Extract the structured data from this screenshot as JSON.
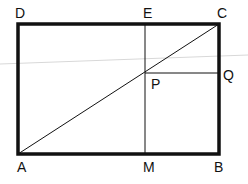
{
  "diagram": {
    "type": "geometry",
    "points": {
      "A": {
        "label": "A",
        "x": 18,
        "y": 154
      },
      "B": {
        "label": "B",
        "x": 219,
        "y": 154
      },
      "C": {
        "label": "C",
        "x": 219,
        "y": 24
      },
      "D": {
        "label": "D",
        "x": 18,
        "y": 24
      },
      "E": {
        "label": "E",
        "x": 145,
        "y": 24
      },
      "M": {
        "label": "M",
        "x": 145,
        "y": 154
      },
      "P": {
        "label": "P",
        "x": 145,
        "y": 73
      },
      "Q": {
        "label": "Q",
        "x": 219,
        "y": 73
      }
    },
    "segments": [
      "AB",
      "BC",
      "CD",
      "DA",
      "AC",
      "EM",
      "PQ"
    ],
    "colors": {
      "stroke": "#111111",
      "faint_line": "#d8d8d8",
      "background": "#ffffff"
    }
  },
  "labels": {
    "A": "A",
    "B": "B",
    "C": "C",
    "D": "D",
    "E": "E",
    "M": "M",
    "P": "P",
    "Q": "Q"
  }
}
